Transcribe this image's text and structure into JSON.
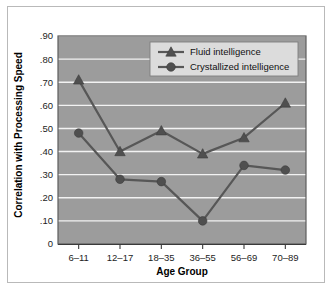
{
  "chart_data": {
    "type": "line",
    "title": "",
    "xlabel": "Age Group",
    "ylabel": "Correlation with Processing Speed",
    "categories": [
      "6–11",
      "12–17",
      "18–35",
      "36–55",
      "56–69",
      "70–89"
    ],
    "ylim": [
      0,
      0.9
    ],
    "ytick_labels": [
      ".90",
      ".80",
      ".70",
      ".60",
      ".50",
      ".40",
      ".30",
      ".20",
      ".10",
      "0"
    ],
    "ytick_values": [
      0.9,
      0.8,
      0.7,
      0.6,
      0.5,
      0.4,
      0.3,
      0.2,
      0.1,
      0
    ],
    "grid": true,
    "legend_position": "top-right",
    "series": [
      {
        "name": "Fluid intelligence",
        "marker": "triangle",
        "values": [
          0.71,
          0.4,
          0.49,
          0.39,
          0.46,
          0.61
        ]
      },
      {
        "name": "Crystallized intelligence",
        "marker": "circle",
        "values": [
          0.48,
          0.28,
          0.27,
          0.1,
          0.34,
          0.32
        ]
      }
    ],
    "colors": {
      "plot_background": "#9c9c9c",
      "gridline": "#f2f2f2",
      "series_line": "#575757",
      "marker": "#4f4f4f",
      "legend_background": "#dcdcdc",
      "axis": "#3a3a3a",
      "text": "#111111",
      "figure_border": "#b9b9b9"
    }
  }
}
